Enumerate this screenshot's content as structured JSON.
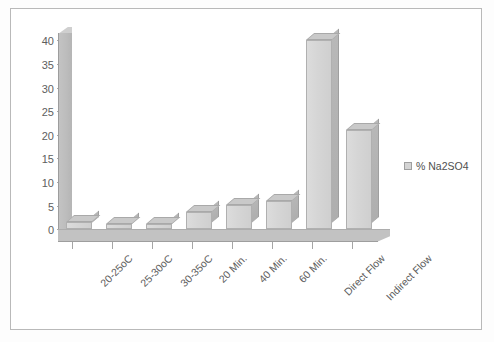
{
  "chart_data": {
    "type": "bar",
    "title": "",
    "xlabel": "",
    "ylabel": "",
    "ylim": [
      0,
      40
    ],
    "yticks": [
      0,
      5,
      10,
      15,
      20,
      25,
      30,
      35,
      40
    ],
    "grid": false,
    "legend_position": "right",
    "categories": [
      "20-25oC",
      "25-30oC",
      "30-35oC",
      "20 Min.",
      "40 Min.",
      "60 Min.",
      "Direct Flow",
      "Indirect Flow"
    ],
    "series": [
      {
        "name": "% Na2SO4",
        "values": [
          1.5,
          1,
          1,
          3.5,
          5,
          6,
          40,
          21
        ],
        "color": "#d4d4d4"
      }
    ]
  },
  "legend": {
    "entries": [
      {
        "label": "% Na2SO4",
        "swatch": "legend-swatch-na2so4"
      }
    ]
  },
  "axis": {
    "y": {
      "ticks": [
        "40",
        "35",
        "30",
        "25",
        "20",
        "15",
        "10",
        "5",
        "0"
      ]
    }
  }
}
